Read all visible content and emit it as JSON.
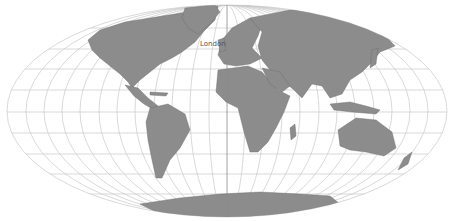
{
  "map": {
    "projection": "Mollweide",
    "colors": {
      "land": "#8c8c8c",
      "grid": "#c8c8c8",
      "background": "#ffffff",
      "central_meridian": "#8a8a8a"
    },
    "labels": [
      {
        "name": "London",
        "x": 200,
        "y": 46
      }
    ]
  }
}
